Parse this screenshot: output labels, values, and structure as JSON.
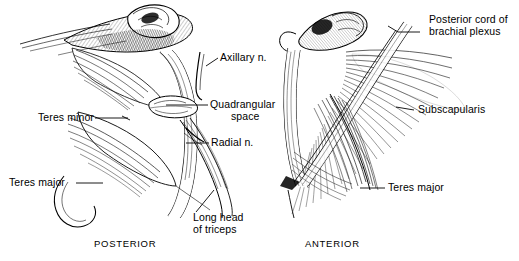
{
  "figure": {
    "type": "anatomical-illustration",
    "style": "pen-and-ink line engraving, black on white",
    "background_color": "#ffffff",
    "ink_color": "#000000",
    "panels": [
      {
        "id": "left",
        "caption": "POSTERIOR"
      },
      {
        "id": "right",
        "caption": "ANTERIOR"
      }
    ]
  },
  "labels": {
    "axillary_n": "Axillary n.",
    "quadrangular_line1": "Quadrangular",
    "quadrangular_line2": "space",
    "radial_n": "Radial n.",
    "teres_minor": "Teres minor",
    "teres_major_left": "Teres major",
    "long_head_line1": "Long head",
    "long_head_line2": "of triceps",
    "posterior_cord_line1": "Posterior cord of",
    "posterior_cord_line2": "brachial plexus",
    "subscapularis": "Subscapularis",
    "teres_major_right": "Teres major"
  },
  "captions": {
    "posterior": "POSTERIOR",
    "anterior": "ANTERIOR"
  }
}
